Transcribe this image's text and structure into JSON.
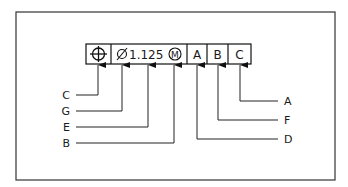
{
  "diagram": {
    "type": "feature-control-frame",
    "frame": {
      "geometric_characteristic": {
        "symbol": "position-icon",
        "name": "True Position"
      },
      "tolerance": {
        "diameter_symbol": "⌀",
        "value": "1.125",
        "modifier": "M"
      },
      "datums": [
        "A",
        "B",
        "C"
      ]
    },
    "callouts_left": [
      {
        "label": "C",
        "points_to": "geometric characteristic symbol"
      },
      {
        "label": "G",
        "points_to": "diameter symbol"
      },
      {
        "label": "E",
        "points_to": "tolerance value"
      },
      {
        "label": "B",
        "points_to": "material condition modifier"
      }
    ],
    "callouts_right": [
      {
        "label": "A",
        "points_to": "tertiary datum C"
      },
      {
        "label": "F",
        "points_to": "secondary datum B"
      },
      {
        "label": "D",
        "points_to": "primary datum A"
      }
    ]
  }
}
